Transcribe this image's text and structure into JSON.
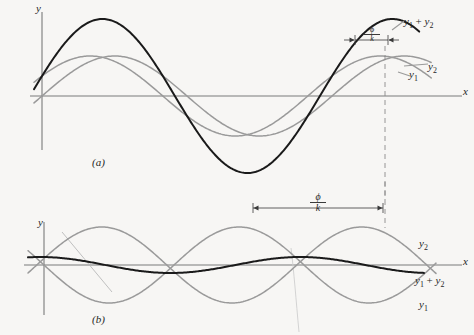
{
  "figure": {
    "background": "#f7f6f4",
    "curve_color_sum": "#1a1a1a",
    "curve_color_component": "#9a9a9a",
    "axis_color": "#7a7a7a",
    "text_color": "#262626"
  },
  "panel_a": {
    "panel_label": "(a)",
    "y_axis_label": "y",
    "x_axis_label": "x",
    "label_sum": "y1 + y2",
    "label_y1": "y1",
    "label_y2": "y2",
    "phase_numerator": "ϕ",
    "phase_denominator": "k"
  },
  "panel_b": {
    "panel_label": "(b)",
    "y_axis_label": "y",
    "x_axis_label": "x",
    "label_sum": "y1 + y2",
    "label_y1": "y1",
    "label_y2": "y2",
    "phase_numerator": "ϕ",
    "phase_denominator": "k"
  },
  "chart_data": {
    "type": "line",
    "xlabel": "x",
    "ylabel": "y",
    "grid": false,
    "legend": "inline end-of-curve labels",
    "panels": [
      {
        "id": "a",
        "label": "(a)",
        "caption": "Small phase difference: waves nearly in phase, sum has large amplitude",
        "axis": {
          "x_axis_y": 96,
          "y_axis_x": 42,
          "x_start": 30,
          "x_end": 462
        },
        "annotation": {
          "text": "phi/k",
          "x_from": 355,
          "x_to": 388,
          "y": 40,
          "style": "inward-arrows"
        },
        "dashed_line_x": 385,
        "series": [
          {
            "name": "y1",
            "amplitude": 40,
            "wavelength": 290,
            "phase_deg": 0,
            "color": "#9a9a9a"
          },
          {
            "name": "y2",
            "amplitude": 40,
            "wavelength": 290,
            "phase_deg": 30,
            "color": "#9a9a9a"
          },
          {
            "name": "y1 + y2",
            "amplitude": 77,
            "wavelength": 290,
            "phase_deg": 15,
            "color": "#1a1a1a"
          }
        ]
      },
      {
        "id": "b",
        "label": "(b)",
        "caption": "Phase difference near 180 degrees: waves nearly out of phase, sum has small amplitude",
        "axis": {
          "x_axis_y": 265,
          "y_axis_x": 44,
          "x_start": 24,
          "x_end": 462
        },
        "annotation": {
          "text": "phi/k",
          "x_from": 253,
          "x_to": 383,
          "y": 208,
          "style": "outward-arrows"
        },
        "dashed_line_x": 385,
        "series": [
          {
            "name": "y1",
            "amplitude": 38,
            "wavelength": 260,
            "phase_deg": 180,
            "color": "#9a9a9a"
          },
          {
            "name": "y2",
            "amplitude": 38,
            "wavelength": 260,
            "phase_deg": 10,
            "color": "#9a9a9a"
          },
          {
            "name": "y1 + y2",
            "amplitude": 8,
            "wavelength": 260,
            "phase_deg": 95,
            "color": "#1a1a1a"
          }
        ]
      }
    ]
  }
}
